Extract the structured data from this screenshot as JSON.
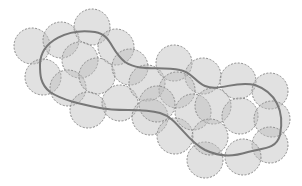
{
  "diagram": {
    "colors": {
      "disk_fill": "#bdbdbd",
      "disk_fill_opacity": 0.45,
      "disk_stroke": "#8a8a8a",
      "path_stroke": "#777777",
      "background": "#ffffff"
    },
    "disk_radius": 18,
    "disks": [
      {
        "cx": 32,
        "cy": 46
      },
      {
        "cx": 61,
        "cy": 40
      },
      {
        "cx": 92,
        "cy": 27
      },
      {
        "cx": 116,
        "cy": 47
      },
      {
        "cx": 80,
        "cy": 60
      },
      {
        "cx": 43,
        "cy": 77
      },
      {
        "cx": 68,
        "cy": 88
      },
      {
        "cx": 97,
        "cy": 76
      },
      {
        "cx": 130,
        "cy": 67
      },
      {
        "cx": 88,
        "cy": 110
      },
      {
        "cx": 120,
        "cy": 103
      },
      {
        "cx": 147,
        "cy": 83
      },
      {
        "cx": 174,
        "cy": 63
      },
      {
        "cx": 203,
        "cy": 76
      },
      {
        "cx": 238,
        "cy": 81
      },
      {
        "cx": 270,
        "cy": 91
      },
      {
        "cx": 177,
        "cy": 90
      },
      {
        "cx": 150,
        "cy": 117
      },
      {
        "cx": 175,
        "cy": 136
      },
      {
        "cx": 193,
        "cy": 112
      },
      {
        "cx": 213,
        "cy": 106
      },
      {
        "cx": 240,
        "cy": 116
      },
      {
        "cx": 272,
        "cy": 119
      },
      {
        "cx": 270,
        "cy": 145
      },
      {
        "cx": 243,
        "cy": 157
      },
      {
        "cx": 205,
        "cy": 160
      },
      {
        "cx": 210,
        "cy": 137
      },
      {
        "cx": 157,
        "cy": 104
      }
    ],
    "path_d": "M 40 65 C 40 40, 70 28, 95 32 C 112 35, 110 50, 125 62 C 140 72, 160 66, 180 70 C 192 72, 195 82, 205 86 C 220 92, 235 80, 255 85 C 275 92, 285 110, 280 135 C 276 150, 262 148, 248 152 C 235 156, 222 158, 205 150 C 185 140, 178 118, 160 113 C 140 108, 120 112, 100 108 C 80 104, 62 100, 50 92 C 40 84, 40 74, 40 65 Z"
  }
}
